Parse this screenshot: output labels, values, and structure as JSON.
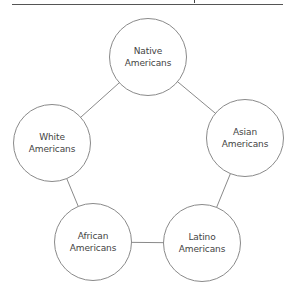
{
  "diagram": {
    "nodes": [
      {
        "id": "native",
        "line1": "Native",
        "line2": "Americans",
        "cx": 148,
        "cy": 57
      },
      {
        "id": "asian",
        "line1": "Asian",
        "line2": "Americans",
        "cx": 245,
        "cy": 138
      },
      {
        "id": "latino",
        "line1": "Latino",
        "line2": "Americans",
        "cx": 202,
        "cy": 243
      },
      {
        "id": "african",
        "line1": "African",
        "line2": "Americans",
        "cx": 93,
        "cy": 242
      },
      {
        "id": "white",
        "line1": "White",
        "line2": "Americans",
        "cx": 52,
        "cy": 143
      }
    ],
    "edges": [
      [
        "native",
        "asian"
      ],
      [
        "asian",
        "latino"
      ],
      [
        "latino",
        "african"
      ],
      [
        "african",
        "white"
      ],
      [
        "white",
        "native"
      ]
    ],
    "colors": {
      "stroke": "#8a8a8a",
      "text": "#444444",
      "background": "#ffffff"
    }
  }
}
